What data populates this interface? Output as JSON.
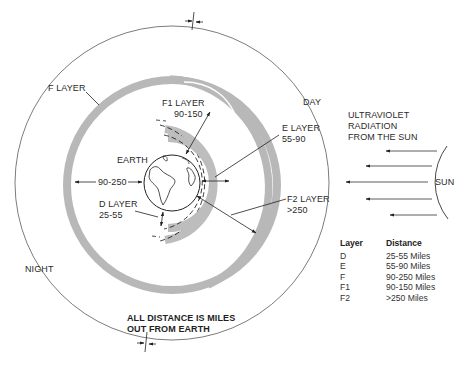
{
  "diagram": {
    "labels": {
      "f_layer": "F LAYER",
      "f1_layer": "F1 LAYER",
      "f1_range": "90-150",
      "e_layer": "E LAYER",
      "e_range": "55-90",
      "earth": "EARTH",
      "f_range": "90-250",
      "d_layer": "D LAYER",
      "d_range": "25-55",
      "f2_layer": "F2 LAYER",
      "f2_range": ">250",
      "day": "DAY",
      "night": "NIGHT",
      "uv_line1": "ULTRAVIOLET",
      "uv_line2": "RADIATION",
      "uv_line3": "FROM THE SUN",
      "sun": "SUN",
      "note_line1": "ALL DISTANCE IS MILES",
      "note_line2": "OUT FROM EARTH"
    },
    "legend": {
      "header_layer": "Layer",
      "header_distance": "Distance",
      "rows": [
        {
          "layer": "D",
          "distance": "25-55 Miles"
        },
        {
          "layer": "E",
          "distance": "55-90 Miles"
        },
        {
          "layer": "F",
          "distance": "90-250 Miles"
        },
        {
          "layer": "F1",
          "distance": "90-150 Miles"
        },
        {
          "layer": "F2",
          "distance": ">250 Miles"
        }
      ]
    },
    "colors": {
      "band": "#b9b9b9",
      "line": "#333333",
      "background": "#ffffff"
    }
  }
}
